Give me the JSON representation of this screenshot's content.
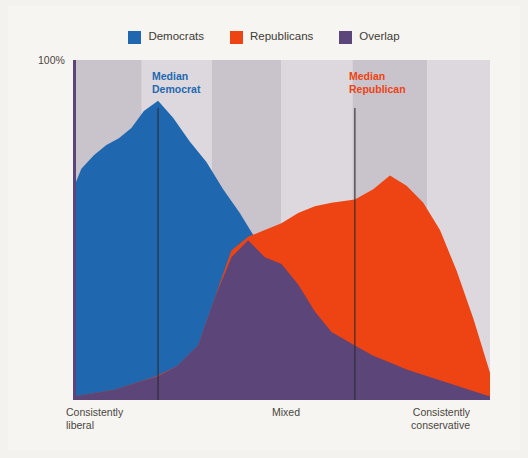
{
  "page": {
    "background_color": "#f4f2ee",
    "card_color": "#f7f5f1"
  },
  "bleed_through": {
    "title": "Organizing elections",
    "line1": "a comparatively polarized is a comparatively many",
    "line2": "the most more options ways. Well as related ideas. Polarizing in politic",
    "line3": "its and still their voters. Would are perceived as political parties",
    "line4": "and the still"
  },
  "legend": {
    "items": [
      {
        "label": "Democrats",
        "color": "#1f68b0",
        "icon": "square-swatch-icon"
      },
      {
        "label": "Republicans",
        "color": "#ee4312",
        "icon": "square-swatch-icon"
      },
      {
        "label": "Overlap",
        "color": "#5c4578",
        "icon": "square-swatch-icon"
      }
    ]
  },
  "axes": {
    "y_top_label": "100%",
    "x_left_label": "Consistently\nliberal",
    "x_left_line1": "Consistently",
    "x_left_line2": "liberal",
    "x_mid_label": "Mixed",
    "x_right_line1": "Consistently",
    "x_right_line2": "conservative"
  },
  "annotations": {
    "median_democrat": {
      "line1": "Median",
      "line2": "Democrat",
      "color": "#1f68b0",
      "x_position_pct": 20.4
    },
    "median_republican": {
      "line1": "Median",
      "line2": "Republican",
      "color": "#ee4312",
      "x_position_pct": 67.6
    }
  },
  "colors": {
    "democrat": "#1f68b0",
    "republican": "#ee4312",
    "overlap": "#5c4578",
    "band_dark": "#c9c3cc",
    "band_light": "#dcd8dd",
    "median_line": "#2e2a2e",
    "left_edge_rule": "#5c4578",
    "text": "#3d3a36"
  },
  "chart_data": {
    "type": "area",
    "title": "",
    "subtitle": "",
    "xlabel": "",
    "ylabel": "",
    "ylim": [
      0,
      100
    ],
    "xlim": [
      0,
      100
    ],
    "grid": false,
    "legend_position": "top-center",
    "x_tick_labels": [
      "Consistently liberal",
      "Mixed",
      "Consistently conservative"
    ],
    "y_tick_labels": [
      "100%"
    ],
    "background_bands": [
      {
        "x_start": 0.0,
        "x_end": 16.5,
        "shade": "dark"
      },
      {
        "x_start": 16.5,
        "x_end": 33.3,
        "shade": "light"
      },
      {
        "x_start": 33.3,
        "x_end": 50.0,
        "shade": "dark"
      },
      {
        "x_start": 50.0,
        "x_end": 67.0,
        "shade": "light"
      },
      {
        "x_start": 67.0,
        "x_end": 85.0,
        "shade": "dark"
      },
      {
        "x_start": 85.0,
        "x_end": 100.0,
        "shade": "light"
      }
    ],
    "series": [
      {
        "name": "Democrats",
        "color": "#1f68b0",
        "x": [
          0,
          2,
          5,
          8,
          11,
          14,
          17,
          20.4,
          24,
          28,
          32,
          36,
          40,
          44,
          48,
          52,
          56,
          60,
          64,
          68,
          72,
          76,
          80,
          85,
          90,
          95,
          100
        ],
        "values": [
          62,
          68,
          72,
          75,
          77,
          80,
          85,
          88,
          83,
          76,
          70,
          62,
          55,
          47,
          42,
          40,
          34,
          26,
          20,
          16,
          13,
          11,
          9,
          7,
          5,
          3,
          1
        ]
      },
      {
        "name": "Republicans",
        "color": "#ee4312",
        "x": [
          0,
          5,
          10,
          15,
          20,
          25,
          30,
          34,
          38,
          42,
          46,
          50,
          54,
          58,
          62,
          67.6,
          72,
          76,
          80,
          84,
          88,
          92,
          96,
          100
        ],
        "values": [
          1,
          2,
          3,
          5,
          7,
          10,
          16,
          30,
          44,
          48,
          50,
          52,
          55,
          57,
          58,
          59,
          62,
          66,
          63,
          58,
          50,
          38,
          24,
          8
        ]
      },
      {
        "name": "Overlap",
        "color": "#5c4578",
        "x": [
          0,
          5,
          10,
          15,
          20.4,
          25,
          30,
          34,
          38,
          42,
          46,
          50,
          54,
          58,
          62,
          67.6,
          72,
          76,
          80,
          85,
          90,
          95,
          100
        ],
        "values": [
          1,
          2,
          3,
          5,
          7,
          10,
          16,
          30,
          42,
          47,
          42,
          40,
          34,
          26,
          20,
          16,
          13,
          11,
          9,
          7,
          5,
          3,
          1
        ]
      }
    ]
  }
}
